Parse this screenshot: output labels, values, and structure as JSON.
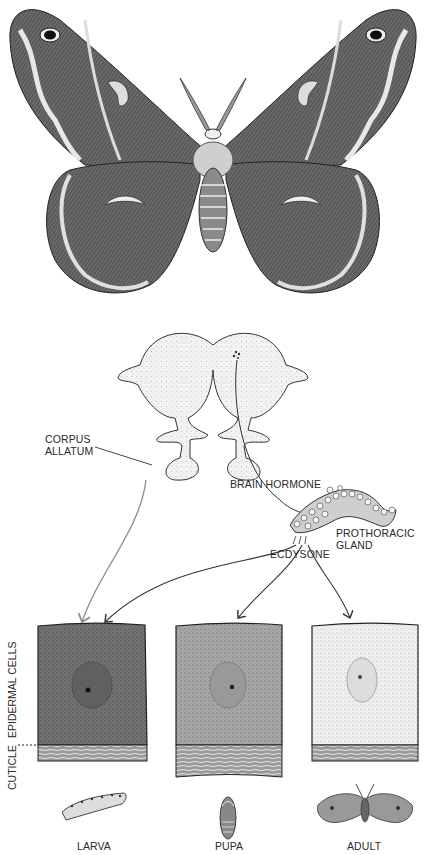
{
  "figure": {
    "labels": {
      "corpus_allatum": [
        "CORPUS",
        "ALLATUM"
      ],
      "brain_hormone": "BRAIN HORMONE",
      "prothoracic_gland": [
        "PROTHORACIC",
        "GLAND"
      ],
      "ecdysone": "ECDYSONE",
      "side_label_cuticle": "CUTICLE",
      "side_label_epidermal": "EPIDERMAL CELLS"
    },
    "stages": [
      {
        "name": "LARVA",
        "cell_shade": "#6d6d6d"
      },
      {
        "name": "PUPA",
        "cell_shade": "#a3a3a3"
      },
      {
        "name": "ADULT",
        "cell_shade": "#e8e8e8"
      }
    ],
    "colors": {
      "ink": "#2a2a2a",
      "juvenile_arrow": "#8a8a8a",
      "ecdysone_arrow": "#333333"
    }
  }
}
